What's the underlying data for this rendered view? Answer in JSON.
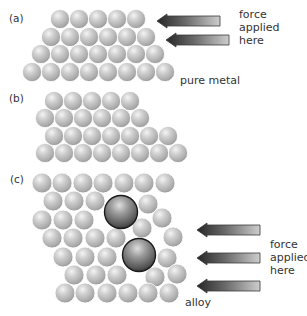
{
  "panels": [
    {
      "id": "a",
      "label": "(a)",
      "label_pos": [
        9,
        12
      ],
      "caption": "pure metal",
      "caption_pos": [
        180,
        74
      ],
      "force_text": "force\napplied\nhere",
      "force_text_pos": [
        239,
        8
      ],
      "arrows": [
        {
          "tip_x": 157,
          "end_x": 220,
          "y": 21
        },
        {
          "tip_x": 166,
          "end_x": 229,
          "y": 40
        }
      ],
      "atom_radius": 9.6,
      "rows": [
        {
          "y": 19,
          "x": [
            60,
            79,
            98,
            117,
            136
          ]
        },
        {
          "y": 37,
          "x": [
            51,
            70,
            89,
            108,
            127,
            146
          ]
        },
        {
          "y": 54,
          "x": [
            41,
            60,
            79,
            98,
            117,
            136,
            155
          ]
        },
        {
          "y": 72,
          "x": [
            32,
            51,
            70,
            89,
            108,
            127,
            146,
            165
          ]
        }
      ]
    },
    {
      "id": "b",
      "label": "(b)",
      "label_pos": [
        9,
        92
      ],
      "atom_radius": 9.6,
      "rows": [
        {
          "y": 101,
          "x": [
            54,
            73,
            92,
            111,
            130
          ]
        },
        {
          "y": 118,
          "x": [
            45,
            64,
            83,
            102,
            121,
            140
          ]
        },
        {
          "y": 136,
          "x": [
            54,
            73,
            92,
            111,
            130,
            149,
            168
          ]
        },
        {
          "y": 153,
          "x": [
            45,
            64,
            83,
            102,
            121,
            140,
            159,
            178
          ]
        }
      ]
    },
    {
      "id": "c",
      "label": "(c)",
      "label_pos": [
        10,
        173
      ],
      "caption": "alloy",
      "caption_pos": [
        185,
        296
      ],
      "force_text": "force\napplied\nhere",
      "force_text_pos": [
        270,
        238
      ],
      "arrows": [
        {
          "tip_x": 197,
          "end_x": 260,
          "y": 230
        },
        {
          "tip_x": 197,
          "end_x": 260,
          "y": 258
        },
        {
          "tip_x": 197,
          "end_x": 260,
          "y": 286
        }
      ],
      "atom_radius": 10,
      "atoms": [
        [
          42,
          183
        ],
        [
          62,
          183
        ],
        [
          83,
          183
        ],
        [
          103,
          183
        ],
        [
          124,
          183
        ],
        [
          144,
          183
        ],
        [
          165,
          183
        ],
        [
          53,
          201
        ],
        [
          74,
          201
        ],
        [
          95,
          201
        ],
        [
          148,
          204
        ],
        [
          42,
          220
        ],
        [
          63,
          220
        ],
        [
          84,
          220
        ],
        [
          142,
          228
        ],
        [
          162,
          218
        ],
        [
          52,
          238
        ],
        [
          73,
          238
        ],
        [
          95,
          238
        ],
        [
          116,
          238
        ],
        [
          173,
          237
        ],
        [
          63,
          257
        ],
        [
          85,
          257
        ],
        [
          107,
          257
        ],
        [
          167,
          258
        ],
        [
          74,
          275
        ],
        [
          96,
          275
        ],
        [
          117,
          275
        ],
        [
          155,
          277
        ],
        [
          177,
          274
        ],
        [
          65,
          293
        ],
        [
          85,
          293
        ],
        [
          107,
          293
        ],
        [
          128,
          293
        ],
        [
          148,
          293
        ],
        [
          169,
          293
        ]
      ],
      "large_atoms": [
        {
          "x": 121,
          "y": 212,
          "r": 16.5
        },
        {
          "x": 139,
          "y": 255,
          "r": 16.5
        }
      ]
    }
  ],
  "colors": {
    "atom_highlight": "#f2f2f2",
    "atom_body": "#b8b8b8",
    "atom_rim": "#8c8c8c",
    "large_highlight": "#d8d8d8",
    "large_body": "#6e6e6e",
    "large_rim": "#1e1e1e",
    "arrow_dark": "#2a2a2a",
    "arrow_light": "#c8c8c8",
    "text": "#333333"
  }
}
